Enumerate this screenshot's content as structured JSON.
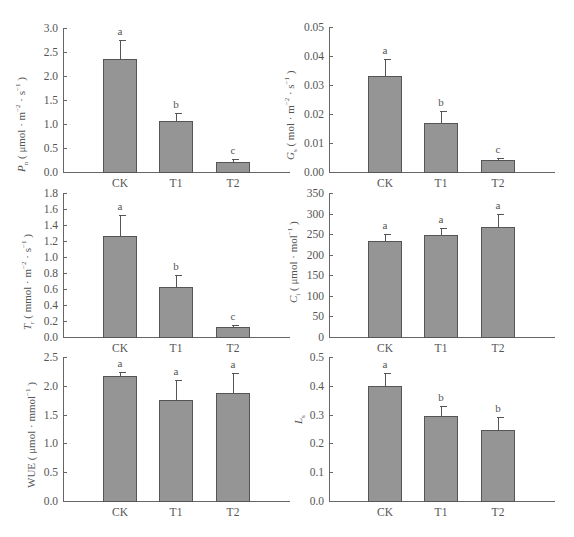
{
  "chart_data": [
    {
      "type": "bar",
      "id": "Pn",
      "ylabel": "Pn ( μmol · m⁻² · s⁻¹ )",
      "ylabel_symbol": "P",
      "ylabel_sub": "n",
      "ylabel_unit": "( μmol · m",
      "ylabel_tail": " · s",
      "categories": [
        "CK",
        "T1",
        "T2"
      ],
      "values": [
        2.35,
        1.06,
        0.21
      ],
      "errors": [
        0.4,
        0.17,
        0.06
      ],
      "significance": [
        "a",
        "b",
        "c"
      ],
      "ylim": [
        0,
        3.0
      ],
      "yticks": [
        "0.0",
        "0.5",
        "1.0",
        "1.5",
        "2.0",
        "2.5",
        "3.0"
      ]
    },
    {
      "type": "bar",
      "id": "Gs",
      "ylabel": "Gs ( mol · m⁻² · s⁻¹ )",
      "categories": [
        "CK",
        "T1",
        "T2"
      ],
      "values": [
        0.033,
        0.017,
        0.004
      ],
      "errors": [
        0.006,
        0.004,
        0.001
      ],
      "significance": [
        "a",
        "b",
        "c"
      ],
      "ylim": [
        0,
        0.05
      ],
      "yticks": [
        "0.00",
        "0.01",
        "0.02",
        "0.03",
        "0.04",
        "0.05"
      ]
    },
    {
      "type": "bar",
      "id": "Tr",
      "ylabel": "Tr ( mmol · m⁻² · s⁻¹ )",
      "categories": [
        "CK",
        "T1",
        "T2"
      ],
      "values": [
        1.26,
        0.63,
        0.12
      ],
      "errors": [
        0.27,
        0.14,
        0.03
      ],
      "significance": [
        "a",
        "b",
        "c"
      ],
      "ylim": [
        0,
        1.8
      ],
      "yticks": [
        "0.0",
        "0.2",
        "0.4",
        "0.6",
        "0.8",
        "1.0",
        "1.2",
        "1.4",
        "1.6",
        "1.8"
      ]
    },
    {
      "type": "bar",
      "id": "Ci",
      "ylabel": "Ci ( μmol · mol⁻¹ )",
      "categories": [
        "CK",
        "T1",
        "T2"
      ],
      "values": [
        234,
        247,
        268
      ],
      "errors": [
        16,
        17,
        30
      ],
      "significance": [
        "a",
        "a",
        "a"
      ],
      "ylim": [
        0,
        350
      ],
      "yticks": [
        "0",
        "50",
        "100",
        "150",
        "200",
        "250",
        "300",
        "350"
      ]
    },
    {
      "type": "bar",
      "id": "WUE",
      "ylabel": "WUE ( μmol · mmol⁻¹ )",
      "categories": [
        "CK",
        "T1",
        "T2"
      ],
      "values": [
        2.17,
        1.76,
        1.87
      ],
      "errors": [
        0.07,
        0.34,
        0.35
      ],
      "significance": [
        "a",
        "a",
        "a"
      ],
      "ylim": [
        0,
        2.5
      ],
      "yticks": [
        "0.0",
        "0.5",
        "1.0",
        "1.5",
        "2.0",
        "2.5"
      ]
    },
    {
      "type": "bar",
      "id": "Ls",
      "ylabel": "Ls",
      "categories": [
        "CK",
        "T1",
        "T2"
      ],
      "values": [
        0.4,
        0.295,
        0.245
      ],
      "errors": [
        0.045,
        0.035,
        0.045
      ],
      "significance": [
        "a",
        "b",
        "b"
      ],
      "ylim": [
        0,
        0.5
      ],
      "yticks": [
        "0.0",
        "0.1",
        "0.2",
        "0.3",
        "0.4",
        "0.5"
      ]
    }
  ],
  "labels": {
    "pn": {
      "sym": "P",
      "sub": "n",
      "pre": "( μmol · m",
      "sup1": "−2",
      "mid": " · s",
      "sup2": "−1",
      "post": " )"
    },
    "gs": {
      "sym": "G",
      "sub": "s",
      "pre": "( mol · m",
      "sup1": "−2",
      "mid": " · s",
      "sup2": "−1",
      "post": " )"
    },
    "tr": {
      "sym": "T",
      "sub": "r",
      "pre": "( mmol · m",
      "sup1": "−2",
      "mid": " · s",
      "sup2": "−1",
      "post": " )"
    },
    "ci": {
      "sym": "C",
      "sub": "i",
      "pre": "( μmol · mol",
      "sup1": "−1",
      "post": " )"
    },
    "wue": {
      "text": "WUE ( μmol · mmol",
      "sup1": "−1",
      "post": " )"
    },
    "ls": {
      "sym": "L",
      "sub": "s"
    }
  }
}
